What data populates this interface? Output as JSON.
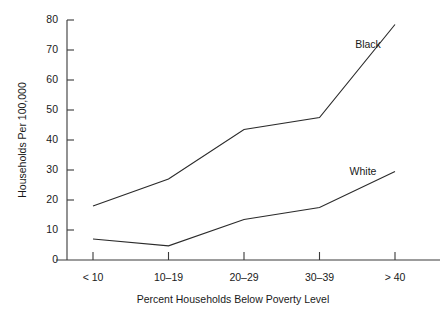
{
  "chart_data": {
    "type": "line",
    "title": "",
    "xlabel": "Percent Households Below Poverty Level",
    "ylabel": "Households Per 100,000",
    "categories": [
      "< 10",
      "10–19",
      "20–29",
      "30–39",
      "> 40"
    ],
    "series": [
      {
        "name": "Black",
        "values": [
          18,
          27,
          43.5,
          47.5,
          78.5
        ],
        "label_text": "Black"
      },
      {
        "name": "White",
        "values": [
          7,
          4.7,
          13.5,
          17.5,
          29.5
        ],
        "label_text": "White"
      }
    ],
    "ylim": [
      0,
      80
    ],
    "yticks": [
      0,
      10,
      20,
      30,
      40,
      50,
      60,
      70,
      80
    ],
    "ytick_labels": [
      "0",
      "10",
      "20",
      "30",
      "40",
      "50",
      "60",
      "70",
      "80"
    ],
    "grid": false,
    "legend_position": "inline-annotation",
    "line_color": "#2b2b2b",
    "axis_color": "#3a3a3a",
    "background": "#ffffff"
  },
  "axes": {
    "y_title": "Households Per 100,000",
    "x_title": "Percent Households Below Poverty Level"
  }
}
